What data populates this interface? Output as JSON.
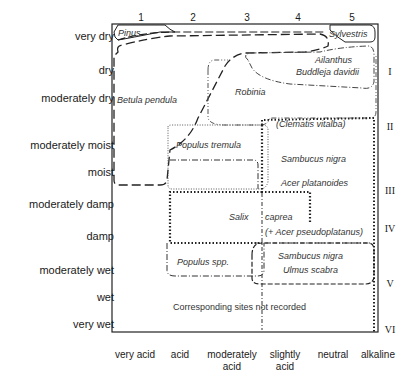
{
  "diagram": {
    "type": "ecological-range-diagram",
    "x_axis": {
      "numbers": [
        "1",
        "2",
        "3",
        "4",
        "5"
      ],
      "labels": [
        {
          "text": "very acid"
        },
        {
          "text": "acid"
        },
        {
          "text": "moderately acid"
        },
        {
          "text": "slightly acid"
        },
        {
          "text": "neutral"
        },
        {
          "text": "alkaline"
        }
      ],
      "label_lines": {
        "very_acid": "very acid",
        "acid": "acid",
        "mod_acid_1": "moderately",
        "mod_acid_2": "acid",
        "slightly_acid_1": "slightly",
        "slightly_acid_2": "acid",
        "neutral": "neutral",
        "alkaline": "alkaline"
      }
    },
    "y_axis": {
      "labels": {
        "very_dry": "very dry",
        "dry": "dry",
        "moderately_dry": "moderately dry",
        "moderately_moist": "moderately moist",
        "moist": "moist",
        "moderately_damp": "moderately damp",
        "damp": "damp",
        "moderately_wet": "moderately wet",
        "wet": "wet",
        "very_wet": "very wet"
      }
    },
    "roman_classes": {
      "I": "I",
      "II": "II",
      "III": "III",
      "IV": "IV",
      "V": "V",
      "VI": "VI"
    },
    "species": {
      "pinus": "Pinus",
      "sylvestris": "Sylvestris",
      "ailanthus": "Ailanthus",
      "buddleja": "Buddleja davidii",
      "betula": "Betula pendula",
      "robinia": "Robinia",
      "clematis": "(Clematis vitalba)",
      "populus_tremula": "Populus tremula",
      "sambucus_1": "Sambucus nigra",
      "acer_platanoides": "Acer platanoides",
      "salix": "Salix",
      "caprea": "caprea",
      "acer_pseudo": "(+ Acer pseudoplatanus)",
      "populus_spp": "Populus spp.",
      "sambucus_2": "Sambucus nigra",
      "ulmus": "Ulmus scabra"
    },
    "note": "Corresponding sites not recorded"
  }
}
